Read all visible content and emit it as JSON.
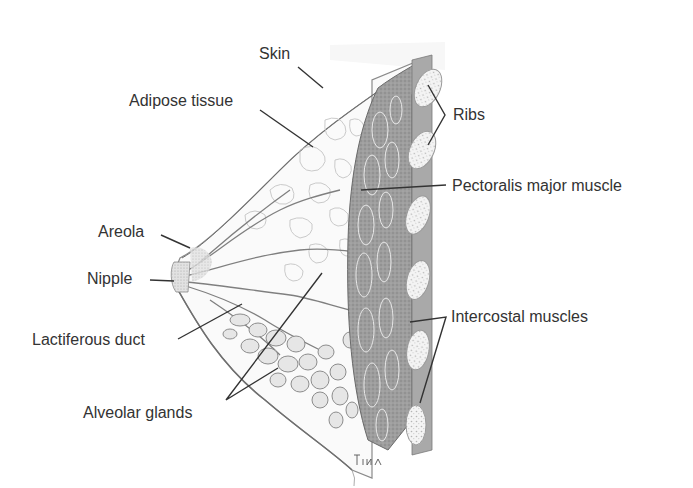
{
  "figure": {
    "signature": "Tina"
  },
  "labels": [
    {
      "id": "skin",
      "text": "Skin"
    },
    {
      "id": "adipose",
      "text": "Adipose tissue"
    },
    {
      "id": "ribs",
      "text": "Ribs"
    },
    {
      "id": "pectoralis",
      "text": "Pectoralis major muscle"
    },
    {
      "id": "areola",
      "text": "Areola"
    },
    {
      "id": "nipple",
      "text": "Nipple"
    },
    {
      "id": "lactiferous",
      "text": "Lactiferous duct"
    },
    {
      "id": "intercostal",
      "text": "Intercostal muscles"
    },
    {
      "id": "alveolar",
      "text": "Alveolar glands"
    }
  ],
  "colors": {
    "text": "#333333",
    "leader_line": "#333333",
    "muscle": "#9a9a9a",
    "muscle_dark": "#7a7a7a",
    "rib": "#f2f2f2",
    "gland": "#dcdcdc",
    "adipose": "#f6f6f6"
  }
}
